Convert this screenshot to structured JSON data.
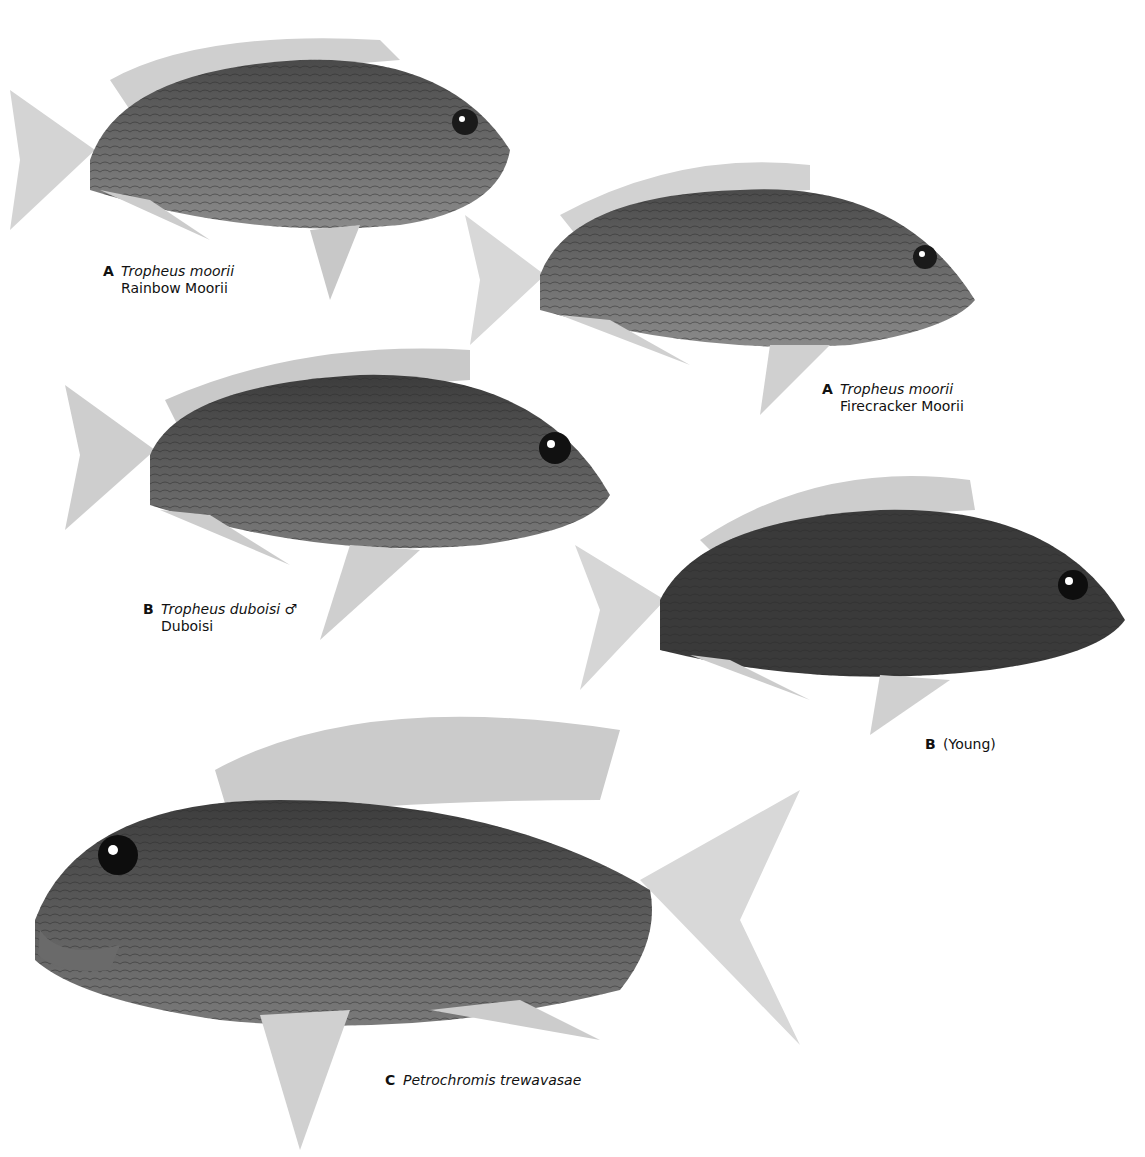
{
  "page": {
    "background": "#ffffff"
  },
  "plates": [
    {
      "id": "fish-a1",
      "letter": "A",
      "scientific_name": "Tropheus moorii",
      "common_name": "Rainbow Moorii",
      "sex_symbol": ""
    },
    {
      "id": "fish-a2",
      "letter": "A",
      "scientific_name": "Tropheus moorii",
      "common_name": "Firecracker Moorii",
      "sex_symbol": ""
    },
    {
      "id": "fish-b1",
      "letter": "B",
      "scientific_name": "Tropheus duboisi",
      "common_name": "Duboisi",
      "sex_symbol": "♂"
    },
    {
      "id": "fish-b2",
      "letter": "B",
      "scientific_name": "",
      "common_name": "(Young)",
      "sex_symbol": ""
    },
    {
      "id": "fish-c",
      "letter": "C",
      "scientific_name": "Petrochromis trewavasae",
      "common_name": "",
      "sex_symbol": ""
    }
  ]
}
